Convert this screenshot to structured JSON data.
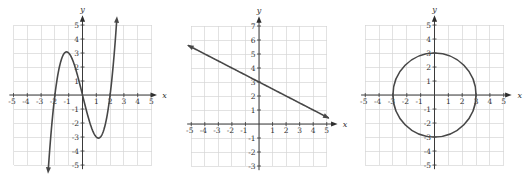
{
  "chart_data": [
    {
      "type": "line",
      "title": "",
      "xlabel": "x",
      "ylabel": "y",
      "xlim": [
        -5,
        5
      ],
      "ylim": [
        -5,
        5
      ],
      "grid": true,
      "legend": null,
      "x_ticks": [
        -5,
        -4,
        -3,
        -2,
        -1,
        1,
        2,
        3,
        4,
        5
      ],
      "y_ticks": [
        -5,
        -4,
        -3,
        -2,
        -1,
        1,
        2,
        3,
        4,
        5
      ],
      "function": {
        "kind": "cubic",
        "expression": "y = x^3 - 4x",
        "coefficients": [
          1,
          0,
          -4,
          0
        ],
        "domain": [
          -2.5,
          2.5
        ],
        "end_arrows": true
      },
      "key_points": {
        "x_intercepts": [
          -2,
          0,
          2
        ],
        "local_max": [
          -1.15,
          3.08
        ],
        "local_min": [
          1.15,
          -3.08
        ]
      },
      "sampled_points": [
        [
          -2.5,
          -5.6
        ],
        [
          -2,
          0
        ],
        [
          -1.15,
          3.08
        ],
        [
          0,
          0
        ],
        [
          1.15,
          -3.08
        ],
        [
          2,
          0
        ],
        [
          2.5,
          5.6
        ]
      ]
    },
    {
      "type": "line",
      "title": "",
      "xlabel": "x",
      "ylabel": "y",
      "xlim": [
        -5,
        5
      ],
      "ylim": [
        -3,
        7
      ],
      "grid": true,
      "legend": null,
      "x_ticks": [
        -5,
        -4,
        -3,
        -2,
        -1,
        1,
        2,
        3,
        4,
        5
      ],
      "y_ticks": [
        -3,
        -2,
        -1,
        1,
        2,
        3,
        4,
        5,
        6,
        7
      ],
      "function": {
        "kind": "linear",
        "expression": "y = -0.5x + 3",
        "slope": -0.5,
        "intercept": 3,
        "domain": [
          -5.3,
          5.2
        ],
        "end_arrows": true
      },
      "key_points": {
        "y_intercept": [
          0,
          3
        ],
        "x_intercept": [
          6,
          0
        ]
      },
      "sampled_points": [
        [
          -5,
          5.5
        ],
        [
          -4,
          5
        ],
        [
          -2,
          4
        ],
        [
          0,
          3
        ],
        [
          2,
          2
        ],
        [
          4,
          1
        ],
        [
          5,
          0.5
        ]
      ]
    },
    {
      "type": "line",
      "title": "",
      "xlabel": "x",
      "ylabel": "y",
      "xlim": [
        -5,
        5
      ],
      "ylim": [
        -5,
        5
      ],
      "grid": true,
      "legend": null,
      "x_ticks": [
        -5,
        -4,
        -3,
        -2,
        -1,
        1,
        2,
        3,
        4,
        5
      ],
      "y_ticks": [
        -5,
        -4,
        -3,
        -2,
        -1,
        1,
        2,
        3,
        4,
        5
      ],
      "function": {
        "kind": "circle",
        "expression": "x^2 + y^2 = 9",
        "center": [
          0,
          0
        ],
        "radius": 3,
        "end_arrows": false
      },
      "key_points": {
        "x_intercepts": [
          -3,
          3
        ],
        "y_intercepts": [
          -3,
          3
        ]
      },
      "sampled_points": [
        [
          3,
          0
        ],
        [
          0,
          3
        ],
        [
          -3,
          0
        ],
        [
          0,
          -3
        ]
      ]
    }
  ],
  "colors": {
    "grid": "#d6d6d6",
    "axis": "#3a3a3a",
    "curve": "#474747",
    "text": "#333333",
    "background": "#ffffff"
  }
}
